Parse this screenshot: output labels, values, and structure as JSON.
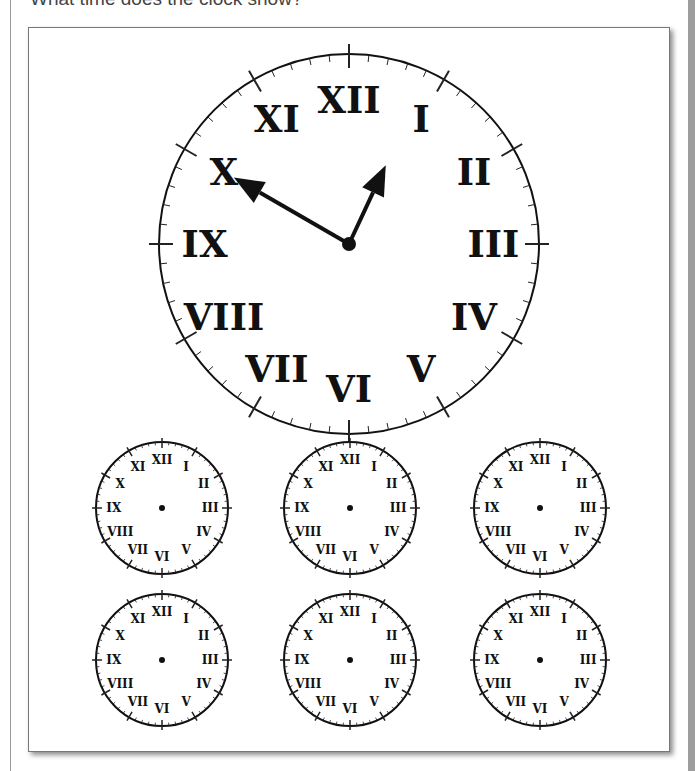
{
  "question": "What time does the clock show?",
  "main_clock": {
    "numerals": [
      "XII",
      "I",
      "II",
      "III",
      "IV",
      "V",
      "VI",
      "VII",
      "VIII",
      "IX",
      "X",
      "XI"
    ],
    "hour_hand_points_to": "between XII and I",
    "minute_hand_points_to": "X",
    "time_shown": "12:50"
  },
  "answer_clocks": [
    {
      "id": 1,
      "numerals": [
        "XII",
        "I",
        "II",
        "III",
        "IV",
        "V",
        "VI",
        "VII",
        "VIII",
        "IX",
        "X",
        "XI"
      ]
    },
    {
      "id": 2,
      "numerals": [
        "XII",
        "I",
        "II",
        "III",
        "IV",
        "V",
        "VI",
        "VII",
        "VIII",
        "IX",
        "X",
        "XI"
      ]
    },
    {
      "id": 3,
      "numerals": [
        "XII",
        "I",
        "II",
        "III",
        "IV",
        "V",
        "VI",
        "VII",
        "VIII",
        "IX",
        "X",
        "XI"
      ]
    },
    {
      "id": 4,
      "numerals": [
        "XII",
        "I",
        "II",
        "III",
        "IV",
        "V",
        "VI",
        "VII",
        "VIII",
        "IX",
        "X",
        "XI"
      ]
    },
    {
      "id": 5,
      "numerals": [
        "XII",
        "I",
        "II",
        "III",
        "IV",
        "V",
        "VI",
        "VII",
        "VIII",
        "IX",
        "X",
        "XI"
      ]
    },
    {
      "id": 6,
      "numerals": [
        "XII",
        "I",
        "II",
        "III",
        "IV",
        "V",
        "VI",
        "VII",
        "VIII",
        "IX",
        "X",
        "XI"
      ]
    }
  ]
}
